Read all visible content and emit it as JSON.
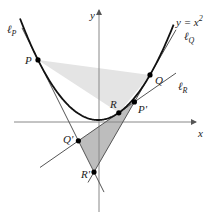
{
  "diagram": {
    "curve_label": "y = x",
    "curve_label_exp": "2",
    "axes": {
      "x_label": "x",
      "y_label": "y"
    },
    "points": {
      "P": "P",
      "Q": "Q",
      "R": "R",
      "P_prime": "P'",
      "Q_prime": "Q'",
      "R_prime": "R'"
    },
    "lines": {
      "lP": {
        "main": "ℓ",
        "sub": "P"
      },
      "lQ": {
        "main": "ℓ",
        "sub": "Q"
      },
      "lR": {
        "main": "ℓ",
        "sub": "R"
      }
    },
    "colors": {
      "curve": "#111111",
      "tangent": "#555555",
      "axis": "#888888",
      "triangle_PQR": "#e4e4e4",
      "triangle_PQR_prime": "#bdbdbd",
      "point": "#000000"
    }
  }
}
